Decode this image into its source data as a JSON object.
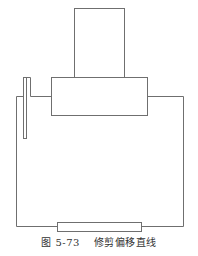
{
  "figure": {
    "caption_label": "图 5-73",
    "caption_title": "修剪偏移直线",
    "stroke_color": "#6f6f6f"
  },
  "shapes": {
    "top_rect": {
      "x": 74,
      "y": 8,
      "w": 50,
      "h": 69
    },
    "middle_rect": {
      "x": 51,
      "y": 77,
      "w": 96,
      "h": 38
    },
    "bottom_rect": {
      "x": 57,
      "y": 222,
      "w": 84,
      "h": 9
    },
    "left_strip": {
      "x": 23,
      "y": 77,
      "w": 3,
      "h": 61
    }
  }
}
